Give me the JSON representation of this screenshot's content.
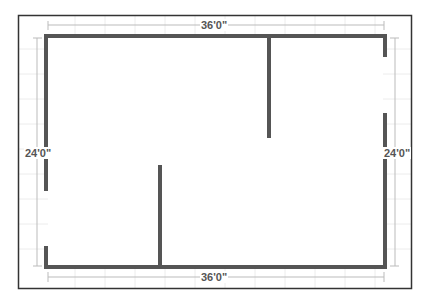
{
  "diagram": {
    "type": "floor-plan",
    "colors": {
      "background": "#ffffff",
      "border": "#333333",
      "wall": "#555555",
      "grid": "#e6e6e6",
      "dimension_line": "#bbbbbb",
      "label": "#555555"
    },
    "dimensions": {
      "top": "36'0\"",
      "bottom": "36'0\"",
      "left": "24'0\"",
      "right": "24'0\""
    },
    "walls": [
      {
        "name": "top-exterior-wall",
        "x1": 46,
        "y1": 36,
        "x2": 385,
        "y2": 36
      },
      {
        "name": "bottom-exterior-wall",
        "x1": 46,
        "y1": 267,
        "x2": 385,
        "y2": 267
      },
      {
        "name": "left-exterior-wall-upper",
        "x1": 46,
        "y1": 36,
        "x2": 46,
        "y2": 190
      },
      {
        "name": "left-exterior-wall-lower",
        "x1": 46,
        "y1": 247,
        "x2": 46,
        "y2": 267
      },
      {
        "name": "right-exterior-wall-upper",
        "x1": 385,
        "y1": 36,
        "x2": 385,
        "y2": 56
      },
      {
        "name": "right-exterior-wall-lower",
        "x1": 385,
        "y1": 114,
        "x2": 385,
        "y2": 267
      },
      {
        "name": "interior-wall-upper",
        "x1": 269,
        "y1": 36,
        "x2": 269,
        "y2": 137
      },
      {
        "name": "interior-wall-lower",
        "x1": 160,
        "y1": 166,
        "x2": 160,
        "y2": 267
      }
    ]
  }
}
